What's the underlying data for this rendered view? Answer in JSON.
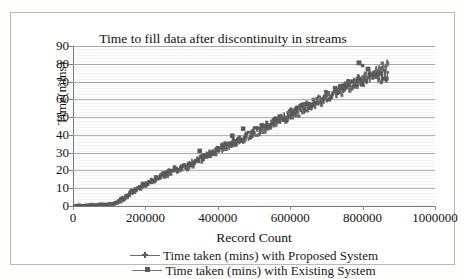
{
  "chart_data": {
    "type": "scatter",
    "title": "Time to fill data after discontinuity in streams",
    "xlabel": "Record Count",
    "ylabel": "Time(mins)",
    "xlim": [
      0,
      1000000
    ],
    "ylim": [
      0,
      90
    ],
    "xticks": [
      0,
      200000,
      400000,
      600000,
      800000,
      1000000
    ],
    "xtick_labels": [
      "0",
      "200000",
      "400000",
      "600000",
      "800000",
      "1000000"
    ],
    "yticks": [
      0,
      10,
      20,
      30,
      40,
      50,
      60,
      70,
      80,
      90
    ],
    "ytick_labels": [
      "0",
      "10",
      "20",
      "30",
      "40",
      "50",
      "60",
      "70",
      "80",
      "90"
    ],
    "grid": "horizontal",
    "legend_position": "bottom",
    "series": [
      {
        "name": "Time taken (mins) with Proposed System",
        "marker": "cross",
        "color": "#6d6d6d",
        "x": [
          0,
          20000,
          40000,
          60000,
          80000,
          100000,
          120000,
          140000,
          160000,
          180000,
          200000,
          220000,
          240000,
          260000,
          280000,
          300000,
          320000,
          340000,
          360000,
          380000,
          400000,
          420000,
          440000,
          460000,
          480000,
          500000,
          520000,
          540000,
          560000,
          580000,
          600000,
          620000,
          640000,
          660000,
          680000,
          700000,
          720000,
          740000,
          760000,
          780000,
          800000,
          820000,
          840000,
          860000,
          870000
        ],
        "y": [
          0,
          0.2,
          0.4,
          0.5,
          0.7,
          0.9,
          1.5,
          4,
          7,
          9.5,
          12,
          14,
          16,
          18,
          20,
          20.5,
          22,
          25,
          27,
          29,
          31,
          33,
          35,
          37,
          39,
          41,
          43,
          45,
          47,
          49,
          51,
          53,
          55,
          57,
          59,
          61,
          63,
          65,
          67,
          69,
          71,
          74,
          76,
          78,
          79
        ]
      },
      {
        "name": "Time taken (mins) with Existing System",
        "marker": "square",
        "color": "#5b5b5b",
        "x": [
          0,
          20000,
          40000,
          60000,
          80000,
          100000,
          120000,
          140000,
          160000,
          180000,
          200000,
          220000,
          240000,
          260000,
          280000,
          300000,
          320000,
          340000,
          360000,
          380000,
          400000,
          420000,
          440000,
          460000,
          480000,
          500000,
          520000,
          540000,
          560000,
          580000,
          600000,
          620000,
          640000,
          660000,
          680000,
          700000,
          720000,
          740000,
          760000,
          780000,
          800000,
          820000,
          840000,
          860000,
          870000
        ],
        "y": [
          0,
          0.2,
          0.4,
          0.6,
          0.8,
          1.0,
          2.0,
          4.5,
          7.5,
          10,
          12.5,
          14.5,
          16.5,
          18.5,
          20.5,
          21,
          23,
          25.5,
          27.5,
          29.5,
          31.5,
          33.5,
          35.5,
          37.5,
          39.5,
          41.5,
          43.5,
          45.5,
          47.5,
          49.5,
          51.5,
          53.5,
          55.5,
          57.5,
          59.5,
          61.5,
          63.5,
          65.5,
          67.5,
          69.5,
          71.5,
          72.5,
          72.8,
          72.5,
          72
        ]
      }
    ],
    "legend": [
      "Time taken (mins) with Proposed System",
      "Time taken (mins) with Existing System"
    ]
  },
  "colors": {
    "series_primary": "#6d6d6d",
    "series_secondary": "#5b5b5b",
    "gridline": "#b0b0b0",
    "axis": "#7a7a7a",
    "frame": "#b9b9b9",
    "background": "#ffffff"
  }
}
